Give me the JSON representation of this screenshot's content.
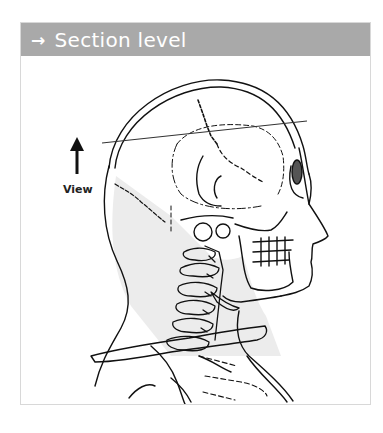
{
  "header": {
    "arrow_icon": "→",
    "title": "Section level"
  },
  "figure": {
    "view_label": "View",
    "section_line": {
      "from": [
        102,
        143
      ],
      "to": [
        307,
        121
      ]
    },
    "colors": {
      "header_bg": "#a9a9a9",
      "header_text": "#ffffff",
      "line": "#111111",
      "neck_fill": "#e8e8e8",
      "panel_border": "#d8d8d8"
    }
  }
}
